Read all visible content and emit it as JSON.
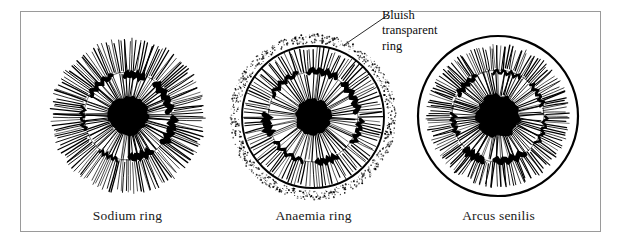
{
  "figure": {
    "type": "iridology-iris-sign-illustration",
    "frame_border_color": "#9a9a9a",
    "background_color": "#ffffff",
    "ink_color": "#000000"
  },
  "panels": [
    {
      "id": "sodium-ring",
      "caption": "Sodium ring",
      "center_x": 93,
      "center_y": 104,
      "pupil_radius": 19,
      "collarette_radius": 44,
      "iris_radius": 78,
      "outer_ring_style": "none",
      "fiber_count": 150
    },
    {
      "id": "anaemia-ring",
      "caption": "Anaemia ring",
      "center_x": 92,
      "center_y": 105,
      "pupil_radius": 17,
      "collarette_radius": 45,
      "iris_radius": 71,
      "outer_ring_style": "solid-plus-stipple",
      "stipple_radius": 78,
      "fiber_count": 120
    },
    {
      "id": "arcus-senilis",
      "caption": "Arcus senilis",
      "center_x": 92,
      "center_y": 104,
      "pupil_radius": 21,
      "collarette_radius": 46,
      "iris_radius": 72,
      "outer_ring_style": "thick-solid-ring",
      "outer_ring_radius": 80,
      "fiber_count": 150
    }
  ],
  "annotation": {
    "lines": [
      "Bluish",
      "transparent",
      "ring"
    ],
    "target_panel": "anaemia-ring"
  },
  "colors": {
    "frame": "#9a9a9a",
    "text": "#1a1a1a",
    "ink": "#000000"
  }
}
